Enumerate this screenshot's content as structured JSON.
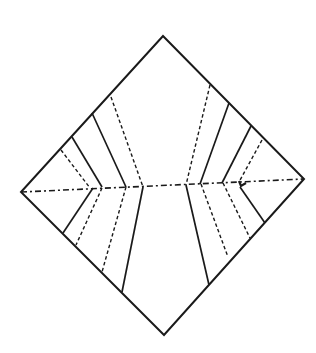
{
  "diagram": {
    "colors": {
      "ink": "#1a1a1a",
      "background": "#ffffff"
    },
    "outline": {
      "points": [
        [
          163,
          36
        ],
        [
          304,
          179
        ],
        [
          164,
          335
        ],
        [
          21,
          192
        ]
      ]
    },
    "centerline": {
      "x1": 21,
      "y1": 192,
      "x2": 304,
      "y2": 179,
      "style": "dash-dot"
    },
    "creases": [
      {
        "id": "ul-valley-1",
        "type": "valley",
        "x1": 61,
        "y1": 150,
        "x2": 90,
        "y2": 188
      },
      {
        "id": "ul-mountain-1",
        "type": "mountain",
        "x1": 72,
        "y1": 137,
        "x2": 102,
        "y2": 187
      },
      {
        "id": "ul-mountain-2",
        "type": "mountain",
        "x1": 92,
        "y1": 113,
        "x2": 126,
        "y2": 187
      },
      {
        "id": "ul-valley-2",
        "type": "valley",
        "x1": 111,
        "y1": 97,
        "x2": 143,
        "y2": 187
      },
      {
        "id": "ll-mountain-1",
        "type": "mountain",
        "x1": 93,
        "y1": 188,
        "x2": 63,
        "y2": 233
      },
      {
        "id": "ll-valley-1",
        "type": "valley",
        "x1": 102,
        "y1": 188,
        "x2": 76,
        "y2": 245
      },
      {
        "id": "ll-valley-2",
        "type": "valley",
        "x1": 126,
        "y1": 187,
        "x2": 102,
        "y2": 272
      },
      {
        "id": "ll-mountain-2",
        "type": "mountain",
        "x1": 143,
        "y1": 187,
        "x2": 122,
        "y2": 292
      },
      {
        "id": "ur-valley-1",
        "type": "valley",
        "x1": 210,
        "y1": 85,
        "x2": 186,
        "y2": 185
      },
      {
        "id": "ur-mountain-1",
        "type": "mountain",
        "x1": 229,
        "y1": 103,
        "x2": 200,
        "y2": 184
      },
      {
        "id": "ur-mountain-2",
        "type": "mountain",
        "x1": 251,
        "y1": 126,
        "x2": 222,
        "y2": 183
      },
      {
        "id": "ur-valley-2",
        "type": "valley",
        "x1": 262,
        "y1": 140,
        "x2": 239,
        "y2": 182
      },
      {
        "id": "lr-mountain-1",
        "type": "mountain",
        "x1": 186,
        "y1": 185,
        "x2": 209,
        "y2": 285
      },
      {
        "id": "lr-valley-1",
        "type": "valley",
        "x1": 201,
        "y1": 184,
        "x2": 228,
        "y2": 257
      },
      {
        "id": "lr-valley-2",
        "type": "valley",
        "x1": 223,
        "y1": 183,
        "x2": 250,
        "y2": 238
      },
      {
        "id": "lr-mountain-2",
        "type": "mountain",
        "x1": 240,
        "y1": 187,
        "x2": 265,
        "y2": 223
      }
    ],
    "marker": {
      "id": "arrow-mark",
      "x": 241,
      "y": 185
    }
  }
}
